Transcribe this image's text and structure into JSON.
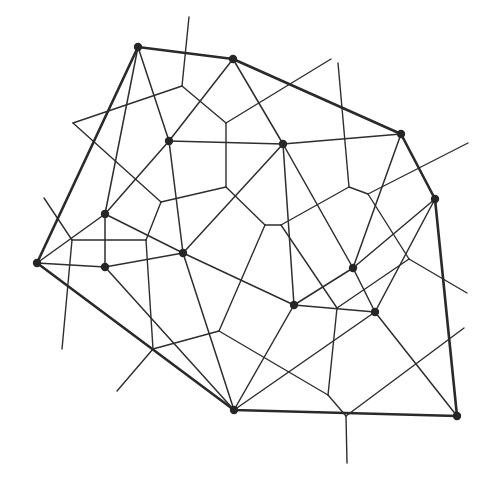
{
  "diagram": {
    "type": "Delaunay triangulation with Voronoi diagram overlay",
    "colors": {
      "background": "#ffffff",
      "stroke": "#2e2e2e",
      "site": "#262626"
    },
    "sites": [
      {
        "id": "A",
        "x": 138,
        "y": 47
      },
      {
        "id": "B",
        "x": 233,
        "y": 59
      },
      {
        "id": "C",
        "x": 401,
        "y": 134
      },
      {
        "id": "D",
        "x": 435,
        "y": 199
      },
      {
        "id": "E",
        "x": 457,
        "y": 416
      },
      {
        "id": "F",
        "x": 234,
        "y": 410
      },
      {
        "id": "G",
        "x": 37,
        "y": 263
      },
      {
        "id": "H",
        "x": 169,
        "y": 141
      },
      {
        "id": "I",
        "x": 283,
        "y": 144
      },
      {
        "id": "J",
        "x": 105,
        "y": 214
      },
      {
        "id": "K",
        "x": 105,
        "y": 267
      },
      {
        "id": "L",
        "x": 183,
        "y": 253
      },
      {
        "id": "M",
        "x": 353,
        "y": 268
      },
      {
        "id": "N",
        "x": 294,
        "y": 305
      },
      {
        "id": "O",
        "x": 375,
        "y": 312
      }
    ],
    "convex_hull": [
      "A",
      "B",
      "C",
      "D",
      "E",
      "F",
      "G"
    ],
    "delaunay_edges": [
      [
        "A",
        "H"
      ],
      [
        "A",
        "J"
      ],
      [
        "B",
        "H"
      ],
      [
        "B",
        "I"
      ],
      [
        "H",
        "I"
      ],
      [
        "H",
        "J"
      ],
      [
        "H",
        "L"
      ],
      [
        "I",
        "L"
      ],
      [
        "I",
        "C"
      ],
      [
        "I",
        "M"
      ],
      [
        "I",
        "N"
      ],
      [
        "C",
        "M"
      ],
      [
        "D",
        "M"
      ],
      [
        "D",
        "O"
      ],
      [
        "M",
        "N"
      ],
      [
        "M",
        "O"
      ],
      [
        "N",
        "O"
      ],
      [
        "N",
        "L"
      ],
      [
        "N",
        "F"
      ],
      [
        "O",
        "F"
      ],
      [
        "O",
        "E"
      ],
      [
        "L",
        "F"
      ],
      [
        "L",
        "J"
      ],
      [
        "L",
        "K"
      ],
      [
        "K",
        "F"
      ],
      [
        "J",
        "K"
      ],
      [
        "J",
        "G"
      ],
      [
        "G",
        "K"
      ]
    ],
    "voronoi_edges": [
      [
        [
          182,
          86
        ],
        [
          189,
          17
        ]
      ],
      [
        [
          182,
          86
        ],
        [
          73,
          123
        ]
      ],
      [
        [
          182,
          86
        ],
        [
          226,
          123
        ]
      ],
      [
        [
          73,
          123
        ],
        [
          161,
          202
        ]
      ],
      [
        [
          226,
          123
        ],
        [
          331,
          59
        ]
      ],
      [
        [
          226,
          123
        ],
        [
          226,
          187
        ]
      ],
      [
        [
          226,
          187
        ],
        [
          161,
          202
        ]
      ],
      [
        [
          226,
          187
        ],
        [
          265,
          225
        ]
      ],
      [
        [
          161,
          202
        ],
        [
          146,
          240
        ]
      ],
      [
        [
          146,
          240
        ],
        [
          72,
          240
        ]
      ],
      [
        [
          72,
          240
        ],
        [
          44,
          198
        ]
      ],
      [
        [
          72,
          240
        ],
        [
          62,
          349
        ]
      ],
      [
        [
          146,
          240
        ],
        [
          153,
          349
        ]
      ],
      [
        [
          153,
          349
        ],
        [
          117,
          391
        ]
      ],
      [
        [
          153,
          349
        ],
        [
          219,
          331
        ]
      ],
      [
        [
          219,
          331
        ],
        [
          265,
          225
        ]
      ],
      [
        [
          265,
          225
        ],
        [
          281,
          225
        ]
      ],
      [
        [
          281,
          225
        ],
        [
          349,
          187
        ]
      ],
      [
        [
          349,
          187
        ],
        [
          338,
          63
        ]
      ],
      [
        [
          349,
          187
        ],
        [
          368,
          194
        ]
      ],
      [
        [
          368,
          194
        ],
        [
          468,
          143
        ]
      ],
      [
        [
          368,
          194
        ],
        [
          409,
          259
        ]
      ],
      [
        [
          409,
          259
        ],
        [
          467,
          293
        ]
      ],
      [
        [
          409,
          259
        ],
        [
          337,
          308
        ]
      ],
      [
        [
          337,
          308
        ],
        [
          281,
          225
        ]
      ],
      [
        [
          337,
          308
        ],
        [
          328,
          395
        ]
      ],
      [
        [
          328,
          395
        ],
        [
          219,
          331
        ]
      ],
      [
        [
          328,
          395
        ],
        [
          346,
          416
        ]
      ],
      [
        [
          346,
          416
        ],
        [
          347,
          463
        ]
      ],
      [
        [
          346,
          416
        ],
        [
          464,
          328
        ]
      ]
    ]
  }
}
